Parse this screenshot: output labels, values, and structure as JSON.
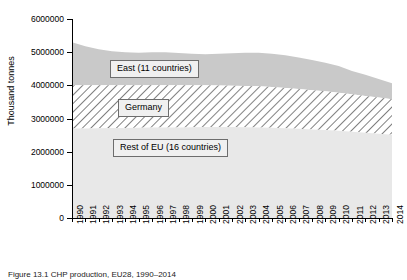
{
  "chart_data": {
    "type": "area",
    "stacked": true,
    "title": "",
    "xlabel": "",
    "ylabel": "Thousand tonnes",
    "ylim": [
      0,
      6000000
    ],
    "ytick_values": [
      0,
      1000000,
      2000000,
      3000000,
      4000000,
      5000000,
      6000000
    ],
    "ytick_labels": [
      "0",
      "1000000",
      "2000000",
      "3000000",
      "4000000",
      "5000000",
      "6000000"
    ],
    "grid": false,
    "legend_position": "inside-callouts",
    "categories": [
      "1990",
      "1991",
      "1992",
      "1993",
      "1994",
      "1995",
      "1996",
      "1997",
      "1998",
      "1999",
      "2000",
      "2001",
      "2002",
      "2003",
      "2004",
      "2005",
      "2006",
      "2007",
      "2008",
      "2009",
      "2010",
      "2011",
      "2012",
      "2013",
      "2014"
    ],
    "series": [
      {
        "name": "Rest of EU (16 countries)",
        "fill": "#e8e8e8",
        "values": [
          2700000,
          2700000,
          2705000,
          2710000,
          2715000,
          2720000,
          2725000,
          2730000,
          2730000,
          2735000,
          2740000,
          2740000,
          2740000,
          2735000,
          2730000,
          2720000,
          2705000,
          2690000,
          2670000,
          2650000,
          2630000,
          2600000,
          2570000,
          2540000,
          2510000
        ]
      },
      {
        "name": "Germany",
        "fill": "#ffffff",
        "hatch": "diagonal",
        "values": [
          1300000,
          1300000,
          1295000,
          1290000,
          1285000,
          1280000,
          1275000,
          1270000,
          1270000,
          1265000,
          1260000,
          1255000,
          1250000,
          1245000,
          1240000,
          1230000,
          1215000,
          1200000,
          1185000,
          1170000,
          1150000,
          1130000,
          1110000,
          1090000,
          1070000
        ]
      },
      {
        "name": "East (11 countries)",
        "fill": "#c9c9c9",
        "values": [
          1300000,
          1180000,
          1090000,
          1030000,
          1000000,
          985000,
          1000000,
          1000000,
          975000,
          950000,
          940000,
          960000,
          975000,
          1000000,
          1010000,
          1000000,
          985000,
          950000,
          910000,
          860000,
          800000,
          700000,
          640000,
          560000,
          480000
        ]
      }
    ],
    "totals": [
      5300000,
      5180000,
      5090000,
      5030000,
      5000000,
      4985000,
      5000000,
      5000000,
      4975000,
      4950000,
      4940000,
      4955000,
      4965000,
      4980000,
      4980000,
      4950000,
      4905000,
      4840000,
      4765000,
      4680000,
      4580000,
      4430000,
      4320000,
      4190000,
      4060000
    ]
  },
  "legend": {
    "east": "East (11 countries)",
    "germany": "Germany",
    "rest": "Rest of EU (16 countries)"
  },
  "caption": "Figure 13.1  CHP production, EU28, 1990–2014"
}
